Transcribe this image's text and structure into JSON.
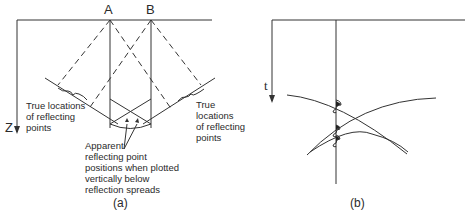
{
  "panel_a": {
    "caption": "(a)",
    "point_a": "A",
    "point_b": "B",
    "axis_label": "Z",
    "left_label": [
      "True locations",
      "of reflecting",
      "points"
    ],
    "right_label": [
      "True",
      "locations",
      "of reflecting",
      "points"
    ],
    "apparent_label": [
      "Apparent",
      "reflecting point",
      "positions when plotted",
      "vertically below",
      "reflection spreads"
    ]
  },
  "panel_b": {
    "caption": "(b)",
    "axis_label": "t"
  },
  "colors": {
    "line": "#333333",
    "background": "#ffffff"
  }
}
